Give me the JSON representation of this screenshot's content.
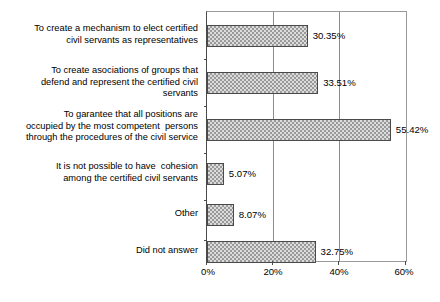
{
  "chart_data": {
    "type": "bar",
    "orientation": "horizontal",
    "title": "",
    "subtitle": "",
    "xlabel": "",
    "ylabel": "",
    "xlim": [
      0,
      60
    ],
    "xtick_labels": [
      "0%",
      "20%",
      "40%",
      "60%"
    ],
    "xticks": [
      0,
      20,
      40,
      60
    ],
    "grid": "vertical gridlines at 20% and 40%",
    "legend": "none",
    "value_label_suffix": "%",
    "categories": [
      "To create a mechanism to elect certified\ncivil servants as representatives",
      "To create asociations of groups that\ndefend and represent the certified civil\nservants",
      "To garantee that all positions are\noccupied by the most competent  persons\nthrough the procedures of the civil service",
      "It is not possible to have  cohesion\namong the certified civil servants",
      "Other",
      "Did not answer"
    ],
    "values": [
      30.35,
      33.51,
      55.42,
      5.07,
      8.07,
      32.75
    ],
    "value_labels": [
      "30.35%",
      "33.51%",
      "55.42%",
      "5.07%",
      "8.07%",
      "32.75%"
    ],
    "bar_fill": "#dcdcdc",
    "bar_hatch": "checkerboard",
    "bar_edge_color": "#4a4a4a",
    "axis_color": "#4a4a4a",
    "grid_color": "#8d8d8d",
    "background": "#ffffff"
  }
}
